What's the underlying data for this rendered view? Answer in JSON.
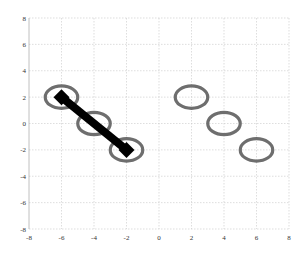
{
  "chart_data": {
    "type": "scatter",
    "title": "",
    "xlabel": "",
    "ylabel": "",
    "xlim": [
      -8,
      8
    ],
    "ylim": [
      -8,
      8
    ],
    "grid": true,
    "legend": null,
    "x_ticks": [
      -8,
      -6,
      -4,
      -2,
      0,
      2,
      4,
      6,
      8
    ],
    "y_ticks": [
      -8,
      -6,
      -4,
      -2,
      0,
      2,
      4,
      6,
      8
    ],
    "x_tick_labels": [
      "-8",
      "-6",
      "-4",
      "-2",
      "0",
      "2",
      "4",
      "6",
      "8"
    ],
    "y_tick_labels": [
      "-8",
      "-6",
      "-4",
      "-2",
      "0",
      "2",
      "4",
      "6",
      "8"
    ],
    "series": [
      {
        "name": "ellipses-left",
        "marker": "ellipse",
        "color": "#6e6e6e",
        "points": [
          [
            -6,
            2
          ],
          [
            -4,
            0
          ],
          [
            -2,
            -2
          ]
        ],
        "rx": 1.0,
        "ry": 0.85
      },
      {
        "name": "ellipses-right",
        "marker": "ellipse",
        "color": "#6e6e6e",
        "points": [
          [
            2,
            2
          ],
          [
            4,
            0
          ],
          [
            6,
            -2
          ]
        ],
        "rx": 1.0,
        "ry": 0.85
      },
      {
        "name": "segment",
        "type": "line",
        "marker": "diamond",
        "color": "#000000",
        "points": [
          [
            -6,
            2
          ],
          [
            -2,
            -2
          ]
        ]
      }
    ]
  },
  "colors": {
    "background": "#ffffff",
    "grid": "#c8c8c8",
    "ellipse": "#6e6e6e",
    "segment": "#000000",
    "tick_text": "#333333"
  }
}
